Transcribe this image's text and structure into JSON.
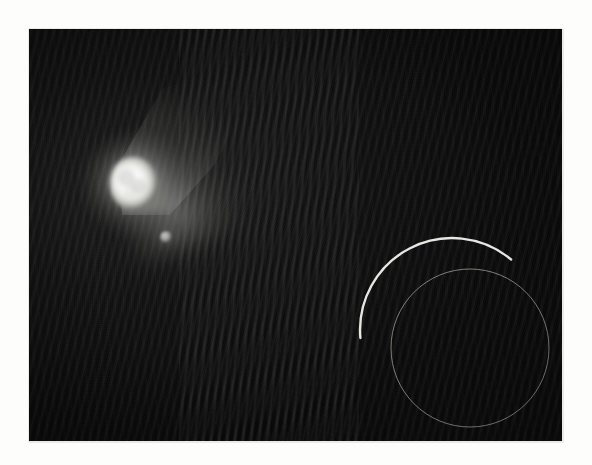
{
  "page": {
    "background_color": "#fdfdfc",
    "kind": "scanned-photographic-print"
  },
  "photograph": {
    "label": "astronomical-photograph",
    "frame": {
      "x": 29,
      "y": 29,
      "width": 533,
      "height": 412
    },
    "background_color": "#070707",
    "texture": "diagonal moire scan pattern",
    "objects": [
      {
        "name": "bright-nucleus",
        "description": "saturated white elongated nucleus with internal mottling",
        "center_x": 134,
        "center_y": 184,
        "radius": 26,
        "peak_color": "#ffffff"
      },
      {
        "name": "coma-plume",
        "description": "diffuse fan-shaped coma extending up and to the right of the nucleus",
        "direction": "up-right",
        "extent_px": 150,
        "color": "#9a9a96"
      },
      {
        "name": "companion-object",
        "description": "small faint companion below and right of the nucleus",
        "center_x": 166,
        "center_y": 237,
        "radius": 6,
        "color": "#a8a8a4"
      }
    ]
  },
  "annotations": {
    "label": "hand-drawn-overlay-markings",
    "stroke_color_bright": "#f2f2ee",
    "stroke_color_faint": "#8e8e8a",
    "items": [
      {
        "name": "bright-arc",
        "type": "arc",
        "center_x": 452,
        "center_y": 330,
        "radius": 92,
        "start_angle_deg": 175,
        "end_angle_deg": 310,
        "stroke_width": 2.4,
        "color": "#f2f2ee"
      },
      {
        "name": "thin-circle",
        "type": "circle",
        "center_x": 470,
        "center_y": 348,
        "radius": 79,
        "stroke_width": 1.0,
        "color": "#8e8e8a"
      }
    ]
  }
}
